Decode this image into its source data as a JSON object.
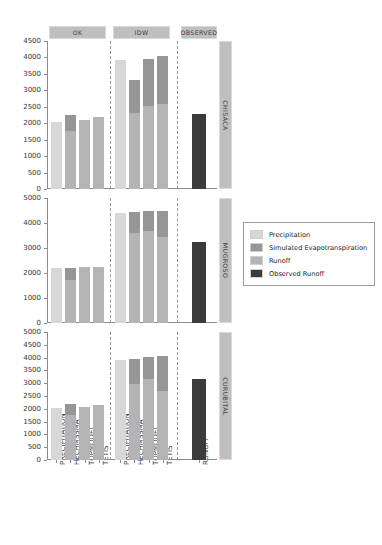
{
  "chart_data": {
    "type": "bar",
    "subtype": "stacked-bar-faceted",
    "title": "",
    "xlabel": "",
    "ylabel": "",
    "grid": false,
    "legend_position": "right",
    "colors": {
      "precipitation": "#d7d7d7",
      "simulated_evapotranspiration": "#969696",
      "runoff": "#b4b4b4",
      "observed_runoff": "#3b3b3b",
      "strip_background": "#bfbfbf",
      "axis": "#8c8c8c",
      "separator": "#9a9a9a"
    },
    "col_facets": [
      "OK",
      "IDW",
      "OBSERVED"
    ],
    "row_facets": [
      "CHISACA",
      "MUGROSO",
      "CURUBITAL"
    ],
    "categories_model": [
      "PRECIPITATION",
      "HECHMSSMA",
      "TOPMODEL",
      "TETIS"
    ],
    "categories_observed": [
      "RUNOFF"
    ],
    "series": [
      {
        "name": "Precipitation",
        "key": "precipitation"
      },
      {
        "name": "Simulated Evapotranspiration",
        "key": "simulated_evapotranspiration"
      },
      {
        "name": "Runoff",
        "key": "runoff"
      },
      {
        "name": "Observed Runoff",
        "key": "observed_runoff"
      }
    ],
    "panels": [
      {
        "row": "CHISACA",
        "ylim": [
          0,
          4500
        ],
        "yticks": [
          0,
          500,
          1000,
          1500,
          2000,
          2500,
          3000,
          3500,
          4000,
          4500
        ],
        "facets": [
          {
            "col": "OK",
            "bars": [
              {
                "category": "PRECIPITATION",
                "precipitation": 2050,
                "simulated_evapotranspiration": 0,
                "runoff": 0,
                "total": 2050
              },
              {
                "category": "HECHMSSMA",
                "precipitation": 0,
                "simulated_evapotranspiration": 480,
                "runoff": 1760,
                "total": 2240
              },
              {
                "category": "TOPMODEL",
                "precipitation": 0,
                "simulated_evapotranspiration": 0,
                "runoff": 2100,
                "total": 2100
              },
              {
                "category": "TETIS",
                "precipitation": 0,
                "simulated_evapotranspiration": 0,
                "runoff": 2190,
                "total": 2190
              }
            ]
          },
          {
            "col": "IDW",
            "bars": [
              {
                "category": "PRECIPITATION",
                "precipitation": 3910,
                "simulated_evapotranspiration": 0,
                "runoff": 0,
                "total": 3910
              },
              {
                "category": "HECHMSSMA",
                "precipitation": 0,
                "simulated_evapotranspiration": 980,
                "runoff": 2320,
                "total": 3300
              },
              {
                "category": "TOPMODEL",
                "precipitation": 0,
                "simulated_evapotranspiration": 1430,
                "runoff": 2520,
                "total": 3950
              },
              {
                "category": "TETIS",
                "precipitation": 0,
                "simulated_evapotranspiration": 1480,
                "runoff": 2570,
                "total": 4050
              }
            ]
          },
          {
            "col": "OBSERVED",
            "bars": [
              {
                "category": "RUNOFF",
                "observed_runoff": 2290,
                "total": 2290
              }
            ]
          }
        ]
      },
      {
        "row": "MUGROSO",
        "ylim": [
          0,
          5000
        ],
        "yticks": [
          0,
          1000,
          2000,
          3000,
          4000,
          5000
        ],
        "facets": [
          {
            "col": "OK",
            "bars": [
              {
                "category": "PRECIPITATION",
                "precipitation": 2190,
                "simulated_evapotranspiration": 0,
                "runoff": 0,
                "total": 2190
              },
              {
                "category": "HECHMSSMA",
                "precipitation": 0,
                "simulated_evapotranspiration": 500,
                "runoff": 1720,
                "total": 2220
              },
              {
                "category": "TOPMODEL",
                "precipitation": 0,
                "simulated_evapotranspiration": 0,
                "runoff": 2250,
                "total": 2250
              },
              {
                "category": "TETIS",
                "precipitation": 0,
                "simulated_evapotranspiration": 0,
                "runoff": 2240,
                "total": 2240
              }
            ]
          },
          {
            "col": "IDW",
            "bars": [
              {
                "category": "PRECIPITATION",
                "precipitation": 4420,
                "simulated_evapotranspiration": 0,
                "runoff": 0,
                "total": 4420
              },
              {
                "category": "HECHMSSMA",
                "precipitation": 0,
                "simulated_evapotranspiration": 840,
                "runoff": 3600,
                "total": 4440
              },
              {
                "category": "TOPMODEL",
                "precipitation": 0,
                "simulated_evapotranspiration": 820,
                "runoff": 3680,
                "total": 4500
              },
              {
                "category": "TETIS",
                "precipitation": 0,
                "simulated_evapotranspiration": 1050,
                "runoff": 3440,
                "total": 4490
              }
            ]
          },
          {
            "col": "OBSERVED",
            "bars": [
              {
                "category": "RUNOFF",
                "observed_runoff": 3230,
                "total": 3230
              }
            ]
          }
        ]
      },
      {
        "row": "CURUBITAL",
        "ylim": [
          0,
          5000
        ],
        "yticks": [
          0,
          500,
          1000,
          1500,
          2000,
          2500,
          3000,
          3500,
          4000,
          4500,
          5000
        ],
        "facets": [
          {
            "col": "OK",
            "bars": [
              {
                "category": "PRECIPITATION",
                "precipitation": 2030,
                "simulated_evapotranspiration": 0,
                "runoff": 0,
                "total": 2030
              },
              {
                "category": "HECHMSSMA",
                "precipitation": 0,
                "simulated_evapotranspiration": 430,
                "runoff": 1740,
                "total": 2170
              },
              {
                "category": "TOPMODEL",
                "precipitation": 0,
                "simulated_evapotranspiration": 0,
                "runoff": 2070,
                "total": 2070
              },
              {
                "category": "TETIS",
                "precipitation": 0,
                "simulated_evapotranspiration": 0,
                "runoff": 2140,
                "total": 2140
              }
            ]
          },
          {
            "col": "IDW",
            "bars": [
              {
                "category": "PRECIPITATION",
                "precipitation": 3920,
                "simulated_evapotranspiration": 0,
                "runoff": 0,
                "total": 3920
              },
              {
                "category": "HECHMSSMA",
                "precipitation": 0,
                "simulated_evapotranspiration": 980,
                "runoff": 2980,
                "total": 3960
              },
              {
                "category": "TOPMODEL",
                "precipitation": 0,
                "simulated_evapotranspiration": 870,
                "runoff": 3160,
                "total": 4030
              },
              {
                "category": "TETIS",
                "precipitation": 0,
                "simulated_evapotranspiration": 1340,
                "runoff": 2710,
                "total": 4050
              }
            ]
          },
          {
            "col": "OBSERVED",
            "bars": [
              {
                "category": "RUNOFF",
                "observed_runoff": 3180,
                "total": 3180
              }
            ]
          }
        ]
      }
    ]
  }
}
